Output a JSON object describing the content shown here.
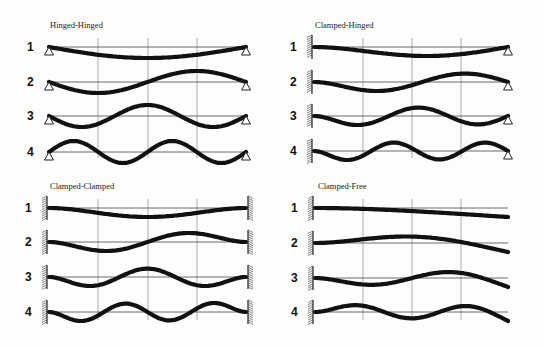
{
  "figure": {
    "mode_numbers": [
      "1",
      "2",
      "3",
      "4"
    ],
    "colors": {
      "beam": "#111111",
      "grid": "#777777",
      "background": "#fdfdfb"
    }
  },
  "panels": [
    {
      "id": "hinged-hinged",
      "title": "Hinged-Hinged",
      "left_support": "hinge",
      "right_support": "hinge",
      "title_pos": [
        50,
        28
      ],
      "x0": 49,
      "x1": 246,
      "grid_x": [
        98,
        148,
        197
      ],
      "grid_y": [
        38,
        158
      ],
      "baselines": [
        47,
        82,
        116,
        152
      ],
      "modes": [
        {
          "n": "1",
          "shape": "sin1"
        },
        {
          "n": "2",
          "shape": "sin2"
        },
        {
          "n": "3",
          "shape": "sin3"
        },
        {
          "n": "4",
          "shape": "sin4"
        }
      ],
      "amp": 11
    },
    {
      "id": "clamped-hinged",
      "title": "Clamped-Hinged",
      "left_support": "clamp",
      "right_support": "hinge",
      "title_pos": [
        315,
        28
      ],
      "x0": 314,
      "x1": 508,
      "grid_x": [
        363,
        412,
        461
      ],
      "grid_y": [
        38,
        158
      ],
      "baselines": [
        47,
        82,
        116,
        151
      ],
      "modes": [
        {
          "n": "1",
          "shape": "ch1"
        },
        {
          "n": "2",
          "shape": "ch2"
        },
        {
          "n": "3",
          "shape": "ch3"
        },
        {
          "n": "4",
          "shape": "ch4"
        }
      ],
      "amp": 9
    },
    {
      "id": "clamped-clamped",
      "title": "Clamped-Clamped",
      "left_support": "clamp",
      "right_support": "clamp",
      "title_pos": [
        50,
        189
      ],
      "x0": 49,
      "x1": 246,
      "grid_x": [
        98,
        148,
        197
      ],
      "grid_y": [
        199,
        320
      ],
      "baselines": [
        208,
        242,
        277,
        312
      ],
      "modes": [
        {
          "n": "1",
          "shape": "cc1"
        },
        {
          "n": "2",
          "shape": "cc2"
        },
        {
          "n": "3",
          "shape": "cc3"
        },
        {
          "n": "4",
          "shape": "cc4"
        }
      ],
      "amp": 9
    },
    {
      "id": "clamped-free",
      "title": "Clamped-Free",
      "left_support": "clamp",
      "right_support": "free",
      "title_pos": [
        318,
        189
      ],
      "x0": 315,
      "x1": 508,
      "grid_x": [
        363,
        412,
        461
      ],
      "grid_y": [
        199,
        320
      ],
      "baselines": [
        208,
        243,
        278,
        312
      ],
      "modes": [
        {
          "n": "1",
          "shape": "cf1"
        },
        {
          "n": "2",
          "shape": "cf2"
        },
        {
          "n": "3",
          "shape": "cf3"
        },
        {
          "n": "4",
          "shape": "cf4"
        }
      ],
      "amp": 9
    }
  ]
}
